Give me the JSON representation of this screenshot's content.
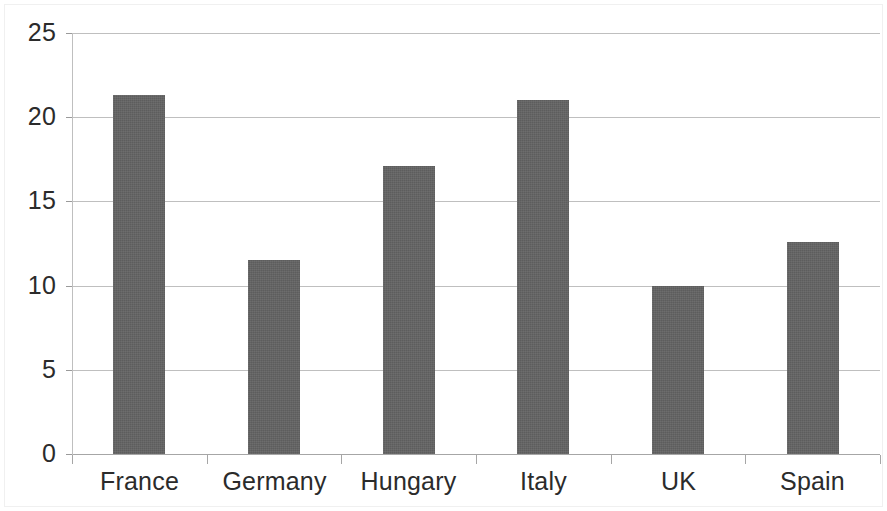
{
  "chart_data": {
    "type": "bar",
    "title": "",
    "subtitle": "",
    "xlabel": "",
    "ylabel": "",
    "categories": [
      "France",
      "Germany",
      "Hungary",
      "Italy",
      "UK",
      "Spain"
    ],
    "values": [
      21.3,
      11.5,
      17.1,
      21.0,
      10.0,
      12.6
    ],
    "ylim": [
      0,
      25
    ],
    "yticks": [
      0,
      5,
      10,
      15,
      20,
      25
    ],
    "ytick_labels": [
      "0",
      "5",
      "10",
      "15",
      "20",
      "25"
    ],
    "grid": true,
    "grid_axis": "y",
    "legend": false,
    "legend_position": "none",
    "series": [
      {
        "name": "",
        "values": [
          21.3,
          11.5,
          17.1,
          21.0,
          10.0,
          12.6
        ]
      }
    ],
    "bar_color": "#636363",
    "gridline_color": "#bfbfbf",
    "axis_color": "#a6a6a6",
    "text_color": "#2b2b2b",
    "background_color": "#ffffff"
  }
}
